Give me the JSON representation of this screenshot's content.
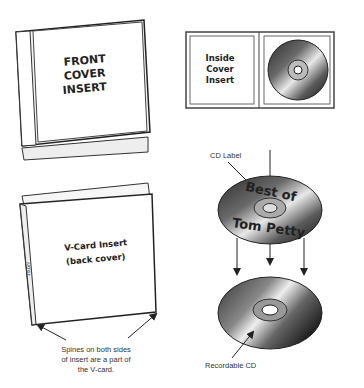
{
  "front_cover": {
    "line1": "FRONT",
    "line2": "COVER",
    "line3": "INSERT"
  },
  "inside_cover": {
    "line1": "Inside",
    "line2": "Cover",
    "line3": "Insert"
  },
  "vcard": {
    "line1": "V-Card Insert",
    "line2": "(back cover)",
    "spine_text": "ARTIST"
  },
  "spines_note": {
    "line1": "Spines on both sides",
    "line2": "of insert are a part of",
    "line3": "the V-card."
  },
  "cd_label": {
    "caption": "CD Label",
    "top_text": "Best of",
    "bottom_text": "Tom Petty"
  },
  "recordable_cd": {
    "caption": "Recordable CD"
  }
}
